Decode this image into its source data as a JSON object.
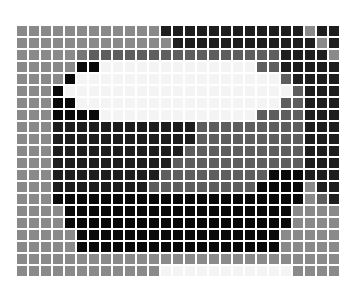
{
  "header": {
    "cropped_text": "▀▀▀▀▀ ▀▀"
  },
  "mosaic": {
    "columns": 27,
    "rows": 21,
    "palette": {
      "G": "#8a8a8a",
      "S": "#767676",
      "M": "#5e5e5e",
      "D": "#1e1e1e",
      "B": "#0a0a0a",
      "W": "#f4f4f4"
    },
    "grid": [
      "GGGGGGGGGGGGDDDDDDDDDDDDGDD",
      "GGGGGGGGGGGGGDDDDDDDDDDDDGD",
      "GGGGGSMMMMMMMMMMMMMMMMDDDDG",
      "GGGGGBBWWWWWWWWWWWWWMMDDDDD",
      "GGGGBWWWWWWWWWWWWWWWWWMDDDD",
      "GGGBWWWWWWWWWWWWWWWWWWWMDDD",
      "GGGBBWWWWWWWWWWWWWWWWWMMDDD",
      "GGGBBBBWWWWWWWWWWWWWMMMMDDD",
      "GGGDDDDDDDDDDDDMMMMMMMMMDDD",
      "GGGDDDDDDDDDDDDMMMMMMMMMDDD",
      "GGGDDDDDDDDDDDMMMMMMMMMMDDD",
      "GGGDDDDDDDDDDMMMMMMMMMMMDDD",
      "GGGDDDDDDDDDMMMMMMMMMBBBDDD",
      "GGGDDDDDDDDMMMMMMMMMBBBBGDD",
      "GGGBBBBBBBBBBBBBBBBBBBBBGMD",
      "GGGGBBBBBBBBBBBBBBBBBBBGGGG",
      "GGGGBBBBBBBBBBBBBBBBBBBGGGG",
      "GGGGGBBBBBBBBBBBBBBBBBGGGGG",
      "GGGGGBBBBBBBBBBBBBBBBBGGGGG",
      "GGGGGGGGGGGGGGGGGGGGGGGGGGG",
      "GGGGGGGGGGGGWWWWWWWWWWWGGGG"
    ]
  }
}
